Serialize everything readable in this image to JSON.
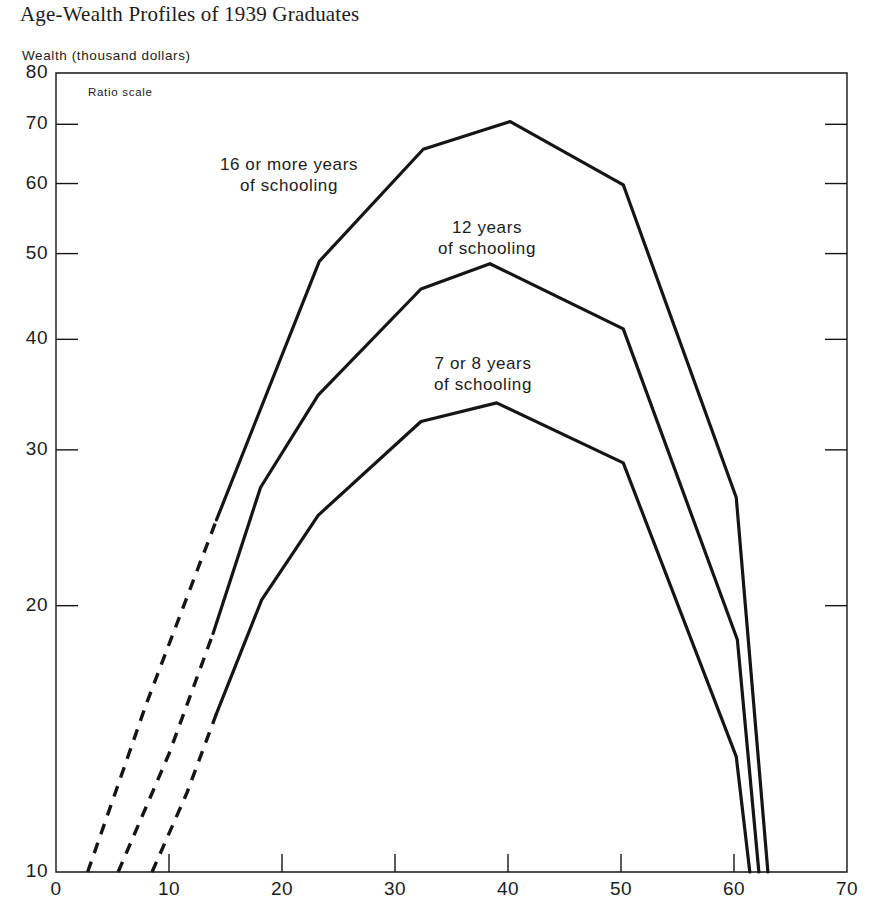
{
  "figure": {
    "title": "Age-Wealth Profiles of 1939 Graduates",
    "y_axis_title": "Wealth (thousand dollars)",
    "scale_note": "Ratio scale"
  },
  "chart_data": {
    "type": "line",
    "title": "Age-Wealth Profiles of 1939 Graduates",
    "xlabel": "",
    "ylabel": "Wealth (thousand dollars)",
    "yscale": "log",
    "scale_note": "Ratio scale",
    "xlim": [
      0,
      70
    ],
    "ylim": [
      10,
      80
    ],
    "xticks": [
      "0",
      "10",
      "20",
      "30",
      "40",
      "50",
      "60",
      "70"
    ],
    "xtick_values": [
      0,
      10,
      20,
      30,
      40,
      50,
      60,
      70
    ],
    "yticks": [
      "10",
      "20",
      "30",
      "40",
      "50",
      "60",
      "70",
      "80"
    ],
    "ytick_values": [
      10,
      20,
      30,
      40,
      50,
      60,
      70,
      80
    ],
    "grid": false,
    "legend": "inline-labels",
    "series": [
      {
        "name": "16 or more years of schooling",
        "label": "16 or more years\nof schooling",
        "dashed_segment": [
          {
            "x": 2.8,
            "y": 10.0
          },
          {
            "x": 8.0,
            "y": 15.5
          },
          {
            "x": 14.2,
            "y": 25.0
          }
        ],
        "points": [
          {
            "x": 14.2,
            "y": 25.0
          },
          {
            "x": 23.3,
            "y": 49.0
          },
          {
            "x": 32.5,
            "y": 65.6
          },
          {
            "x": 40.2,
            "y": 70.5
          },
          {
            "x": 50.2,
            "y": 59.8
          },
          {
            "x": 60.2,
            "y": 26.5
          },
          {
            "x": 63.0,
            "y": 10.0
          }
        ]
      },
      {
        "name": "12 years of schooling",
        "label": "12 years\nof schooling",
        "dashed_segment": [
          {
            "x": 5.5,
            "y": 10.0
          },
          {
            "x": 10.0,
            "y": 13.6
          },
          {
            "x": 13.9,
            "y": 18.6
          }
        ],
        "points": [
          {
            "x": 13.9,
            "y": 18.6
          },
          {
            "x": 18.1,
            "y": 27.2
          },
          {
            "x": 23.2,
            "y": 34.6
          },
          {
            "x": 32.3,
            "y": 45.6
          },
          {
            "x": 38.4,
            "y": 48.7
          },
          {
            "x": 50.2,
            "y": 41.1
          },
          {
            "x": 60.3,
            "y": 18.3
          },
          {
            "x": 62.2,
            "y": 10.0
          }
        ]
      },
      {
        "name": "7 or 8 years of schooling",
        "label": "7 or 8 years\nof schooling",
        "dashed_segment": [
          {
            "x": 8.5,
            "y": 10.0
          },
          {
            "x": 11.6,
            "y": 12.3
          },
          {
            "x": 14.2,
            "y": 15.1
          }
        ],
        "points": [
          {
            "x": 14.2,
            "y": 15.1
          },
          {
            "x": 18.2,
            "y": 20.3
          },
          {
            "x": 23.2,
            "y": 25.3
          },
          {
            "x": 32.3,
            "y": 32.3
          },
          {
            "x": 39.0,
            "y": 33.9
          },
          {
            "x": 50.2,
            "y": 29.0
          },
          {
            "x": 60.2,
            "y": 13.5
          },
          {
            "x": 61.4,
            "y": 10.0
          }
        ]
      }
    ],
    "annotations": [
      {
        "text": "16 or more years\nof schooling",
        "x_px": 289,
        "y_px": 155
      },
      {
        "text": "12 years\nof schooling",
        "x_px": 487,
        "y_px": 218
      },
      {
        "text": "7 or 8 years\nof schooling",
        "x_px": 483,
        "y_px": 354
      },
      {
        "text": "Ratio scale",
        "x_px": 88,
        "y_px": 86
      }
    ],
    "colors": {
      "line": "#151515",
      "axis": "#151515",
      "background": "#ffffff"
    }
  }
}
